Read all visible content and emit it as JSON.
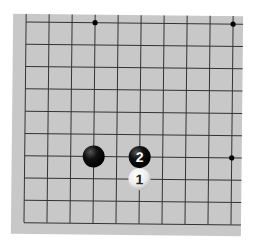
{
  "board": {
    "background_color": "#c8c8c8",
    "line_color": "#333333",
    "columns": 10,
    "rows": 10,
    "cropped_edges": [
      "right",
      "top"
    ]
  },
  "star_points": [
    {
      "col": 3,
      "row": 0
    },
    {
      "col": 9,
      "row": 0
    },
    {
      "col": 9,
      "row": 6
    }
  ],
  "stones": [
    {
      "color": "black",
      "col": 3,
      "row": 6,
      "label": ""
    },
    {
      "color": "black",
      "col": 5,
      "row": 6,
      "label": "2"
    },
    {
      "color": "white",
      "col": 5,
      "row": 7,
      "label": "1"
    }
  ]
}
